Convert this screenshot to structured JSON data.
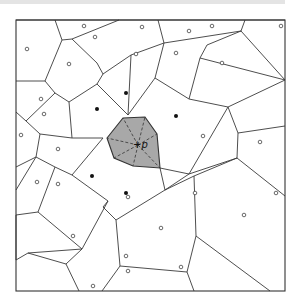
{
  "diagram": {
    "type": "voronoi",
    "query_point_label": "+p",
    "highlight_fill": "#a8a8a8",
    "frame": {
      "x": 16,
      "y": 20,
      "w": 269,
      "h": 271
    },
    "edges": [
      [
        16,
        20,
        55,
        20
      ],
      [
        55,
        20,
        62,
        40
      ],
      [
        62,
        40,
        45,
        81
      ],
      [
        45,
        81,
        16,
        81
      ],
      [
        55,
        20,
        119,
        20
      ],
      [
        119,
        20,
        72,
        39
      ],
      [
        62,
        40,
        72,
        39
      ],
      [
        72,
        39,
        97,
        63
      ],
      [
        97,
        63,
        103,
        74
      ],
      [
        45,
        81,
        55,
        93
      ],
      [
        55,
        93,
        69,
        102
      ],
      [
        69,
        102,
        97,
        84
      ],
      [
        97,
        84,
        103,
        74
      ],
      [
        119,
        20,
        158,
        20
      ],
      [
        158,
        20,
        164,
        43
      ],
      [
        164,
        43,
        131,
        55
      ],
      [
        131,
        55,
        103,
        74
      ],
      [
        97,
        84,
        128,
        115
      ],
      [
        128,
        115,
        131,
        55
      ],
      [
        158,
        20,
        245,
        20
      ],
      [
        245,
        20,
        241,
        31
      ],
      [
        241,
        31,
        164,
        43
      ],
      [
        241,
        31,
        207,
        45
      ],
      [
        207,
        45,
        200,
        58
      ],
      [
        245,
        20,
        285,
        20
      ],
      [
        241,
        31,
        285,
        80
      ],
      [
        164,
        43,
        155,
        78
      ],
      [
        155,
        78,
        128,
        115
      ],
      [
        155,
        78,
        189,
        99
      ],
      [
        189,
        99,
        200,
        58
      ],
      [
        200,
        58,
        285,
        80
      ],
      [
        189,
        99,
        228,
        107
      ],
      [
        228,
        107,
        285,
        80
      ],
      [
        16,
        112,
        26,
        121
      ],
      [
        26,
        121,
        55,
        93
      ],
      [
        26,
        121,
        40,
        134
      ],
      [
        40,
        134,
        36,
        157
      ],
      [
        16,
        167,
        36,
        157
      ],
      [
        69,
        102,
        72,
        138
      ],
      [
        72,
        138,
        40,
        134
      ],
      [
        72,
        138,
        103,
        138
      ],
      [
        36,
        157,
        55,
        167
      ],
      [
        55,
        167,
        72,
        175
      ],
      [
        72,
        175,
        103,
        138
      ],
      [
        36,
        157,
        16,
        190
      ],
      [
        55,
        167,
        38,
        212
      ],
      [
        16,
        215,
        38,
        212
      ],
      [
        228,
        107,
        238,
        133
      ],
      [
        238,
        133,
        285,
        126
      ],
      [
        238,
        133,
        237,
        158
      ],
      [
        160,
        168,
        189,
        174
      ],
      [
        189,
        174,
        228,
        107
      ],
      [
        189,
        174,
        237,
        158
      ],
      [
        160,
        168,
        165,
        190
      ],
      [
        165,
        190,
        189,
        174
      ],
      [
        237,
        158,
        285,
        196
      ],
      [
        237,
        158,
        194,
        176
      ],
      [
        194,
        176,
        196,
        236
      ],
      [
        72,
        175,
        108,
        201
      ],
      [
        108,
        201,
        103,
        207
      ],
      [
        103,
        207,
        116,
        220
      ],
      [
        116,
        220,
        165,
        190
      ],
      [
        38,
        212,
        82,
        249
      ],
      [
        82,
        249,
        108,
        201
      ],
      [
        16,
        215,
        16,
        260
      ],
      [
        16,
        260,
        28,
        253
      ],
      [
        28,
        253,
        82,
        249
      ],
      [
        116,
        220,
        120,
        266
      ],
      [
        120,
        266,
        102,
        291
      ],
      [
        82,
        249,
        66,
        264
      ],
      [
        66,
        264,
        28,
        253
      ],
      [
        66,
        264,
        79,
        291
      ],
      [
        120,
        266,
        187,
        272
      ],
      [
        187,
        272,
        194,
        291
      ],
      [
        196,
        236,
        187,
        272
      ],
      [
        196,
        236,
        270,
        291
      ],
      [
        165,
        190,
        194,
        176
      ]
    ],
    "highlight_cell": [
      [
        107,
        138
      ],
      [
        123,
        118
      ],
      [
        145,
        117
      ],
      [
        157,
        134
      ],
      [
        160,
        168
      ],
      [
        133,
        166
      ],
      [
        114,
        158
      ]
    ],
    "dashed_spokes": [
      [
        [
          138,
          145
        ],
        [
          107,
          138
        ]
      ],
      [
        [
          138,
          145
        ],
        [
          123,
          118
        ]
      ],
      [
        [
          138,
          145
        ],
        [
          145,
          117
        ]
      ],
      [
        [
          138,
          145
        ],
        [
          157,
          134
        ]
      ],
      [
        [
          138,
          145
        ],
        [
          160,
          168
        ]
      ],
      [
        [
          138,
          145
        ],
        [
          133,
          166
        ]
      ],
      [
        [
          138,
          145
        ],
        [
          114,
          158
        ]
      ]
    ],
    "filled_sites": [
      [
        126,
        93
      ],
      [
        97,
        109
      ],
      [
        176,
        116
      ],
      [
        92,
        176
      ],
      [
        126,
        193
      ]
    ],
    "open_sites": [
      [
        84,
        26
      ],
      [
        95,
        37
      ],
      [
        27,
        49
      ],
      [
        69,
        64
      ],
      [
        41,
        99
      ],
      [
        142,
        27
      ],
      [
        189,
        31
      ],
      [
        212,
        26
      ],
      [
        281,
        26
      ],
      [
        136,
        54
      ],
      [
        176,
        53
      ],
      [
        222,
        63
      ],
      [
        21,
        135
      ],
      [
        44,
        114
      ],
      [
        58,
        149
      ],
      [
        37,
        182
      ],
      [
        58,
        184
      ],
      [
        203,
        136
      ],
      [
        260,
        142
      ],
      [
        195,
        193
      ],
      [
        276,
        193
      ],
      [
        128,
        197
      ],
      [
        161,
        228
      ],
      [
        244,
        215
      ],
      [
        73,
        236
      ],
      [
        128,
        271
      ],
      [
        181,
        267
      ],
      [
        126,
        256
      ],
      [
        93,
        286
      ]
    ]
  }
}
